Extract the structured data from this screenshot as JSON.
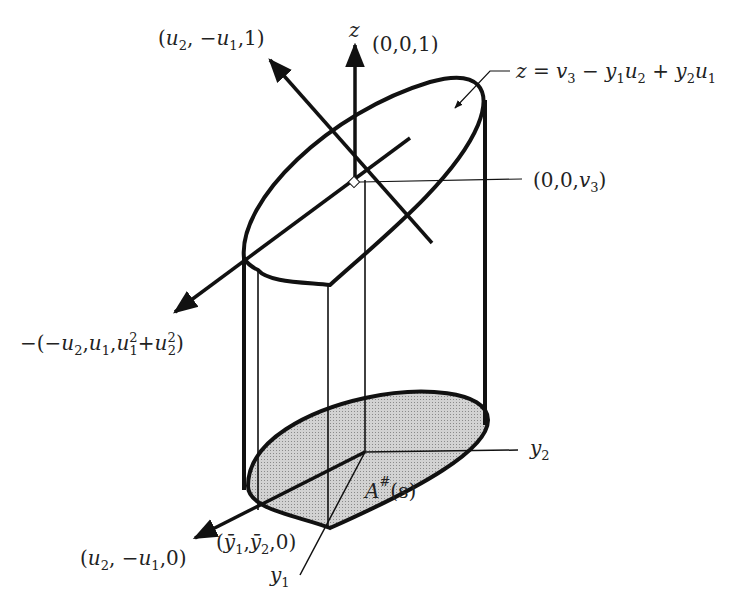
{
  "figure": {
    "colors": {
      "ink": "#111111",
      "shade": "#c8c8c8",
      "background": "#ffffff"
    }
  },
  "labels": {
    "normal_vector": {
      "open": "(",
      "a": "u",
      "a_sub": "2",
      "comma1": ", −",
      "b": "u",
      "b_sub": "1",
      "tail": ",1)"
    },
    "z_axis": "z",
    "z_unit": "(0,0,1)",
    "plane_eq": {
      "lhs": "z = ",
      "v": "v",
      "v_sub": "3",
      "m1": " − ",
      "y1": "y",
      "y1_sub": "1",
      "u2": "u",
      "u2_sub": "2",
      "p": " + ",
      "y2": "y",
      "y2_sub": "2",
      "u1": "u",
      "u1_sub": "1"
    },
    "center_point": {
      "pre": "(0,0,",
      "v": "v",
      "v_sub": "3",
      "post": ")"
    },
    "neg_vector": {
      "pre": "−(−",
      "a": "u",
      "a_sub": "2",
      "c1": ",",
      "b": "u",
      "b_sub": "1",
      "c2": ",",
      "c": "u",
      "c_sup": "2",
      "c_sub": "1",
      "p": "+",
      "d": "u",
      "d_sup": "2",
      "d_sub": "2",
      "post": ")"
    },
    "y2_axis": {
      "v": "y",
      "sub": "2"
    },
    "y1_axis": {
      "v": "y",
      "sub": "1"
    },
    "region": {
      "A": "A",
      "sup": "#",
      "arg": "(s)"
    },
    "base_vector": {
      "open": "(",
      "a": "u",
      "a_sub": "2",
      "c": ", −",
      "b": "u",
      "b_sub": "1",
      "tail": ",0)"
    },
    "base_point": {
      "open": "(",
      "a": "ȳ",
      "a_sub": "1",
      "c": ",",
      "b": "ȳ",
      "b_sub": "2",
      "tail": ",0)"
    }
  }
}
